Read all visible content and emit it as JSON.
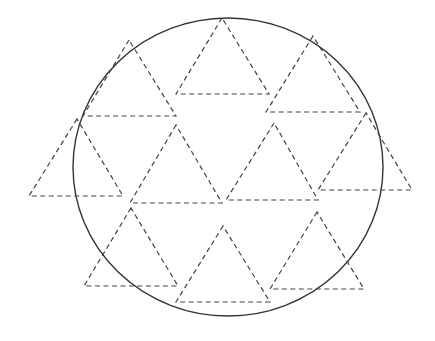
{
  "diagram": {
    "colors": {
      "circle": "#333333",
      "triangles": "#444444",
      "background": "#ffffff"
    },
    "circle": {
      "cx": 228,
      "cy": 167,
      "rx": 155,
      "ry": 149
    },
    "triangles": [
      {
        "apex": [
          129,
          40
        ],
        "base_left": [
          83,
          116
        ],
        "base_right": [
          176,
          116
        ]
      },
      {
        "apex": [
          222,
          18
        ],
        "base_left": [
          176,
          94
        ],
        "base_right": [
          269,
          94
        ]
      },
      {
        "apex": [
          313,
          36
        ],
        "base_left": [
          266,
          112
        ],
        "base_right": [
          360,
          112
        ]
      },
      {
        "apex": [
          77,
          119
        ],
        "base_left": [
          29,
          196
        ],
        "base_right": [
          123,
          196
        ]
      },
      {
        "apex": [
          176,
          125
        ],
        "base_left": [
          130,
          203
        ],
        "base_right": [
          222,
          203
        ]
      },
      {
        "apex": [
          274,
          123
        ],
        "base_left": [
          226,
          200
        ],
        "base_right": [
          318,
          200
        ]
      },
      {
        "apex": [
          366,
          113
        ],
        "base_left": [
          318,
          190
        ],
        "base_right": [
          412,
          190
        ]
      },
      {
        "apex": [
          131,
          208
        ],
        "base_left": [
          84,
          286
        ],
        "base_right": [
          178,
          286
        ]
      },
      {
        "apex": [
          223,
          226
        ],
        "base_left": [
          176,
          302
        ],
        "base_right": [
          270,
          302
        ]
      },
      {
        "apex": [
          317,
          212
        ],
        "base_left": [
          270,
          289
        ],
        "base_right": [
          364,
          289
        ]
      }
    ]
  }
}
